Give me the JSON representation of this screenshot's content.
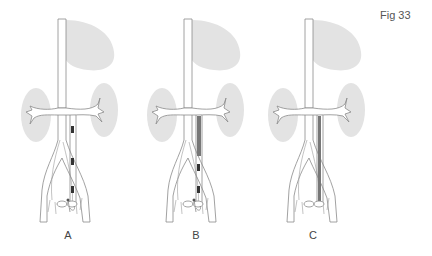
{
  "figure": {
    "label": "Fig 33",
    "panels": [
      {
        "id": "A",
        "label": "A",
        "offset_x": 0,
        "drain": "segmented-clips",
        "lower_clip": true
      },
      {
        "id": "B",
        "label": "B",
        "offset_x": 126,
        "drain": "partial-stent",
        "lower_clip": true
      },
      {
        "id": "C",
        "label": "C",
        "offset_x": 247,
        "drain": "full-stent",
        "lower_clip": false
      }
    ]
  },
  "colors": {
    "organ_fill": "#e3e3e3",
    "vessel_stroke": "#8a8a8a",
    "stent_fill": "#777777",
    "clip_fill": "#333333",
    "text": "#555555"
  }
}
